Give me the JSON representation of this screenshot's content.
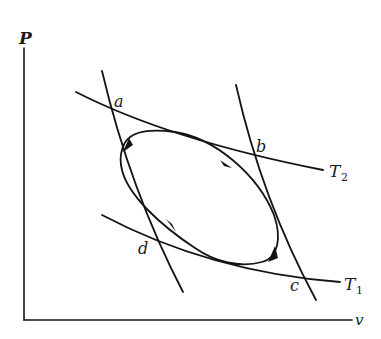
{
  "diagram": {
    "type": "PV cycle diagram",
    "axes": {
      "y_label": "P",
      "x_label": "v"
    },
    "isotherms": [
      {
        "name": "T2",
        "label_main": "T",
        "label_sub": "2"
      },
      {
        "name": "T1",
        "label_main": "T",
        "label_sub": "1"
      }
    ],
    "points": {
      "a": "a",
      "b": "b",
      "c": "c",
      "d": "d"
    },
    "cycle": {
      "shape": "closed elliptical loop",
      "direction": "clockwise arrows"
    },
    "colors": {
      "ink": "#141414",
      "background": "#ffffff"
    }
  }
}
